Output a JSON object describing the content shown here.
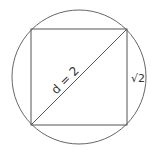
{
  "diagram": {
    "diagonal_label": "d = 2",
    "side_label": "√2",
    "stroke_color": "#555555",
    "background": "#ffffff"
  }
}
